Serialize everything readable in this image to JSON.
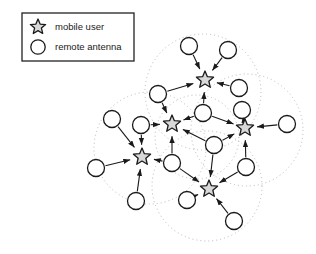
{
  "figure": {
    "type": "network-diagram",
    "title": "",
    "background_color": "#ffffff",
    "width": 316,
    "height": 254
  },
  "legend": {
    "box": {
      "x": 22,
      "y": 13,
      "width": 112,
      "height": 48,
      "border_color": "#222222",
      "fill": "#ffffff"
    },
    "items": [
      {
        "symbol": "star",
        "icon_name": "star-icon",
        "label": "mobile user",
        "symbol_x": 38,
        "symbol_y": 27,
        "label_x": 55,
        "label_y": 30
      },
      {
        "symbol": "circle",
        "icon_name": "circle-icon",
        "label": "remote antenna",
        "symbol_x": 38,
        "symbol_y": 47,
        "label_x": 55,
        "label_y": 50
      }
    ]
  },
  "style": {
    "node_stroke": "#1a1a1a",
    "node_fill": "#ffffff",
    "star_fill": "#d8d8d8",
    "edge_color": "#1a1a1a",
    "coverage_color": "#b9b9b9",
    "star_radius": 9,
    "circle_radius": 8.5,
    "edge_width": 1.1,
    "coverage_dash": "1,3"
  },
  "coverage_areas": [
    {
      "name": "cell-top",
      "cx": 203,
      "cy": 92,
      "r": 58
    },
    {
      "name": "cell-left",
      "cx": 150,
      "cy": 148,
      "r": 56
    },
    {
      "name": "cell-right",
      "cx": 247,
      "cy": 130,
      "r": 56
    },
    {
      "name": "cell-bottom",
      "cx": 207,
      "cy": 186,
      "r": 55
    },
    {
      "name": "cell-center",
      "cx": 197,
      "cy": 137,
      "r": 42
    }
  ],
  "nodes": {
    "mobile_users": [
      {
        "id": "u1",
        "name": "mobile-user-top",
        "x": 205,
        "y": 80
      },
      {
        "id": "u2",
        "name": "mobile-user-midleft",
        "x": 172,
        "y": 124
      },
      {
        "id": "u3",
        "name": "mobile-user-right",
        "x": 245,
        "y": 128
      },
      {
        "id": "u4",
        "name": "mobile-user-lowerleft",
        "x": 142,
        "y": 157
      },
      {
        "id": "u5",
        "name": "mobile-user-bottom",
        "x": 209,
        "y": 189
      }
    ],
    "remote_antennas": [
      {
        "id": "a1",
        "name": "antenna-top-left",
        "x": 189,
        "y": 46
      },
      {
        "id": "a2",
        "name": "antenna-top-right",
        "x": 228,
        "y": 50
      },
      {
        "id": "a3",
        "name": "antenna-upper-right",
        "x": 239,
        "y": 88
      },
      {
        "id": "a4",
        "name": "antenna-upper-left",
        "x": 158,
        "y": 94
      },
      {
        "id": "a5",
        "name": "antenna-center-upper",
        "x": 203,
        "y": 113
      },
      {
        "id": "a6",
        "name": "antenna-right-upper",
        "x": 242,
        "y": 110
      },
      {
        "id": "a7",
        "name": "antenna-far-left",
        "x": 112,
        "y": 119
      },
      {
        "id": "a8",
        "name": "antenna-left-mid",
        "x": 141,
        "y": 125
      },
      {
        "id": "a9",
        "name": "antenna-far-right",
        "x": 287,
        "y": 124
      },
      {
        "id": "a10",
        "name": "antenna-center",
        "x": 214,
        "y": 145
      },
      {
        "id": "a11",
        "name": "antenna-center-left",
        "x": 172,
        "y": 163
      },
      {
        "id": "a12",
        "name": "antenna-left-outer",
        "x": 96,
        "y": 168
      },
      {
        "id": "a13",
        "name": "antenna-right-lower",
        "x": 246,
        "y": 167
      },
      {
        "id": "a14",
        "name": "antenna-bottom-left",
        "x": 136,
        "y": 201
      },
      {
        "id": "a15",
        "name": "antenna-bottom-inner",
        "x": 187,
        "y": 200
      },
      {
        "id": "a16",
        "name": "antenna-bottom-right",
        "x": 234,
        "y": 221
      }
    ]
  },
  "edges": [
    {
      "from": "a1",
      "to": "u1",
      "direction": "to-user"
    },
    {
      "from": "a2",
      "to": "u1",
      "direction": "to-user"
    },
    {
      "from": "a3",
      "to": "u1",
      "direction": "to-user"
    },
    {
      "from": "a4",
      "to": "u1",
      "direction": "to-user"
    },
    {
      "from": "a5",
      "to": "u1",
      "direction": "to-user"
    },
    {
      "from": "a4",
      "to": "u2",
      "direction": "to-user"
    },
    {
      "from": "a8",
      "to": "u2",
      "direction": "to-user"
    },
    {
      "from": "a5",
      "to": "u2",
      "direction": "to-user"
    },
    {
      "from": "a11",
      "to": "u2",
      "direction": "to-user"
    },
    {
      "from": "a10",
      "to": "u2",
      "direction": "to-user"
    },
    {
      "from": "a5",
      "to": "u3",
      "direction": "to-user"
    },
    {
      "from": "a6",
      "to": "u3",
      "direction": "to-user"
    },
    {
      "from": "a9",
      "to": "u3",
      "direction": "to-user"
    },
    {
      "from": "a10",
      "to": "u3",
      "direction": "to-user"
    },
    {
      "from": "a13",
      "to": "u3",
      "direction": "to-user"
    },
    {
      "from": "a7",
      "to": "u4",
      "direction": "to-user"
    },
    {
      "from": "a8",
      "to": "u4",
      "direction": "to-user"
    },
    {
      "from": "a12",
      "to": "u4",
      "direction": "to-user"
    },
    {
      "from": "a14",
      "to": "u4",
      "direction": "to-user"
    },
    {
      "from": "a11",
      "to": "u4",
      "direction": "to-user"
    },
    {
      "from": "a11",
      "to": "u5",
      "direction": "to-user"
    },
    {
      "from": "a10",
      "to": "u5",
      "direction": "to-user"
    },
    {
      "from": "a13",
      "to": "u5",
      "direction": "to-user"
    },
    {
      "from": "a15",
      "to": "u5",
      "direction": "to-user"
    },
    {
      "from": "a16",
      "to": "u5",
      "direction": "to-user"
    }
  ]
}
